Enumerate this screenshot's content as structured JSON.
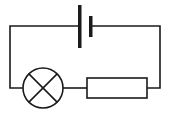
{
  "diagram": {
    "type": "circuit",
    "colors": {
      "stroke": "#1a1a1a",
      "background": "#ffffff"
    },
    "components": [
      {
        "id": "cell",
        "kind": "battery-cell",
        "position": "top-center"
      },
      {
        "id": "lamp",
        "kind": "lamp",
        "position": "bottom-left"
      },
      {
        "id": "resistor",
        "kind": "resistor",
        "position": "bottom-right"
      }
    ],
    "connections": [
      [
        "cell",
        "resistor"
      ],
      [
        "resistor",
        "lamp"
      ],
      [
        "lamp",
        "cell"
      ]
    ]
  }
}
